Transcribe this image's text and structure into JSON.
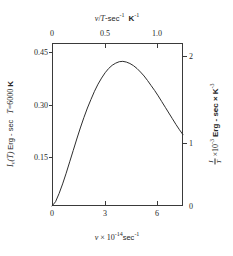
{
  "figure": {
    "background_color": "#ffffff",
    "ink_color": "#3a3a3a"
  },
  "chart_data": {
    "type": "line",
    "title": "",
    "subtitle": "",
    "xlabel": "v × 10⁻¹⁴ sec⁻¹",
    "xlabel_parts": {
      "symbol": "v",
      "times": "×",
      "mantissa": "10",
      "exponent": "-14",
      "unit": "sec",
      "unit_exponent": "-1"
    },
    "ylabel": "Iᵥ(T) Erg - sec    T = 6000 K",
    "ylabel_parts": {
      "quantity": "I",
      "quantity_sub": "v",
      "argument": "(T)",
      "unit": "Erg - sec",
      "condition_symbol": "T",
      "condition_equals": "=",
      "condition_value": "6000",
      "condition_unit": "K"
    },
    "top_axis_label": "v / T - sec⁻¹  K⁻¹",
    "top_axis_label_parts": {
      "numerator": "v",
      "slash": "/",
      "denominator": "T",
      "dash": "-",
      "unit1": "sec",
      "unit1_exponent": "-1",
      "unit2": "K",
      "unit2_exponent": "-1"
    },
    "right_axis_label": "Iᵥ/T³ ×10⁻³ Erg - sec × K⁻³",
    "right_axis_label_parts": {
      "num": "I",
      "num_sub": "v",
      "den": "T",
      "den_exp": "3",
      "times": "×10",
      "times_exp": "-3",
      "unit": "Erg - sec ×",
      "unit2": "K",
      "unit2_exp": "-3"
    },
    "x": [
      0.0,
      0.2,
      0.4,
      0.6,
      0.8,
      1.0,
      1.2,
      1.4,
      1.6,
      1.8,
      2.0,
      2.2,
      2.4,
      2.6,
      2.8,
      3.0,
      3.2,
      3.4,
      3.6,
      3.8,
      4.0,
      4.2,
      4.4,
      4.6,
      4.8,
      5.0,
      5.2,
      5.4,
      5.6,
      5.8,
      6.0,
      6.2,
      6.4,
      6.6,
      6.8,
      7.0,
      7.2,
      7.4
    ],
    "values": [
      0.0,
      0.012,
      0.035,
      0.062,
      0.092,
      0.124,
      0.156,
      0.188,
      0.219,
      0.248,
      0.275,
      0.299,
      0.322,
      0.342,
      0.359,
      0.374,
      0.386,
      0.395,
      0.401,
      0.405,
      0.406,
      0.404,
      0.4,
      0.394,
      0.386,
      0.376,
      0.365,
      0.352,
      0.338,
      0.324,
      0.309,
      0.293,
      0.277,
      0.261,
      0.245,
      0.229,
      0.214,
      0.2
    ],
    "xlim": [
      0.0,
      7.4
    ],
    "ylim": [
      0.0,
      0.4575
    ],
    "xticks": [
      0,
      3,
      6
    ],
    "xticklabels": [
      "0",
      "3",
      "6"
    ],
    "yticks": [
      0.15,
      0.3,
      0.45
    ],
    "yticklabels": [
      "0.15",
      "0.30",
      "0.45"
    ],
    "top_xticks": [
      0,
      0.5,
      1.0
    ],
    "top_xticklabels": [
      "0",
      "0.5",
      "1.0"
    ],
    "right_yticks": [
      0,
      1,
      2
    ],
    "right_yticklabels": [
      "0",
      "1",
      "2"
    ],
    "grid": false,
    "legend": null,
    "line_color": "#2e2e2e",
    "line_width": 1.0,
    "peak": {
      "x": 3.95,
      "y": 0.406
    }
  }
}
